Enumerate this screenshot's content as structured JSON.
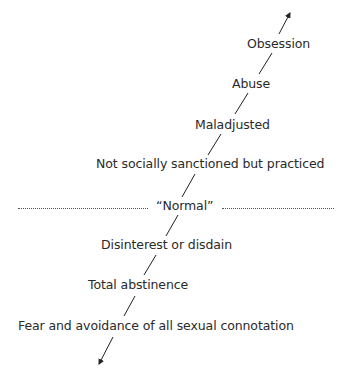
{
  "diagram": {
    "type": "continuum-scale",
    "labels": [
      {
        "id": "obsession",
        "text": "Obsession"
      },
      {
        "id": "abuse",
        "text": "Abuse"
      },
      {
        "id": "maladjusted",
        "text": "Maladjusted"
      },
      {
        "id": "not-sanctioned",
        "text": "Not socially sanctioned but practiced"
      },
      {
        "id": "normal",
        "text": "“Normal”"
      },
      {
        "id": "disinterest",
        "text": "Disinterest or disdain"
      },
      {
        "id": "abstinence",
        "text": "Total abstinence"
      },
      {
        "id": "fear",
        "text": "Fear and avoidance of all sexual connotation"
      }
    ],
    "line_color": "#222222",
    "text_color": "#2a2a2a"
  }
}
